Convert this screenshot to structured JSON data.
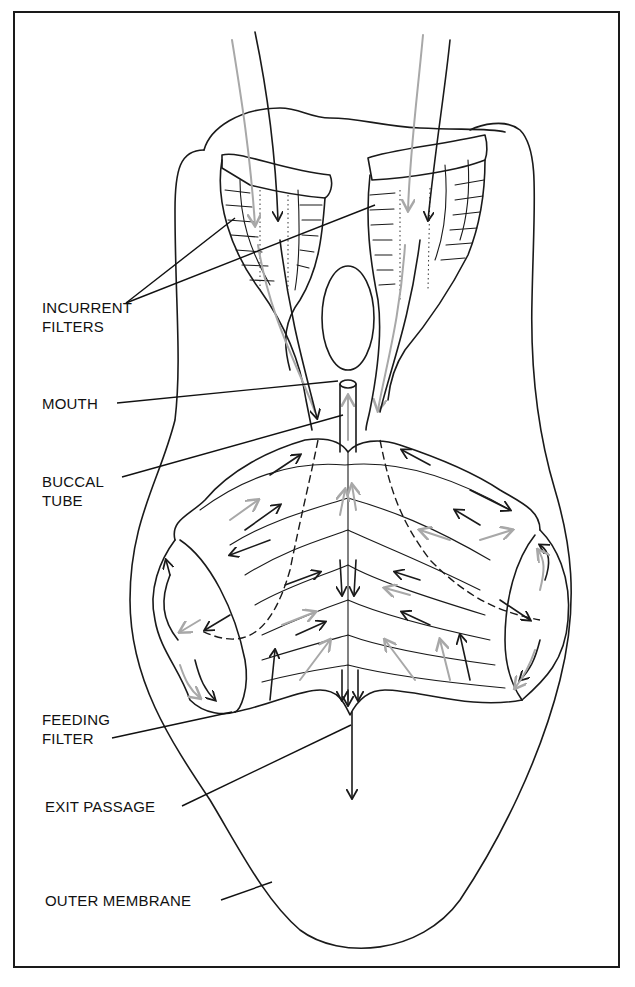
{
  "figure": {
    "type": "labeled anatomical diagram",
    "colors": {
      "ink": "#1a1a1a",
      "flow_arrow_light": "#a8a8a8",
      "background": "#ffffff"
    }
  },
  "labels": [
    {
      "id": "incurrent-filters",
      "lines": [
        "INCURRENT",
        "FILTERS"
      ]
    },
    {
      "id": "mouth",
      "lines": [
        "MOUTH"
      ]
    },
    {
      "id": "buccal-tube",
      "lines": [
        "BUCCAL",
        "TUBE"
      ]
    },
    {
      "id": "feeding-filter",
      "lines": [
        "FEEDING",
        "FILTER"
      ]
    },
    {
      "id": "exit-passage",
      "lines": [
        "EXIT PASSAGE"
      ]
    },
    {
      "id": "outer-membrane",
      "lines": [
        "OUTER MEMBRANE"
      ]
    }
  ]
}
